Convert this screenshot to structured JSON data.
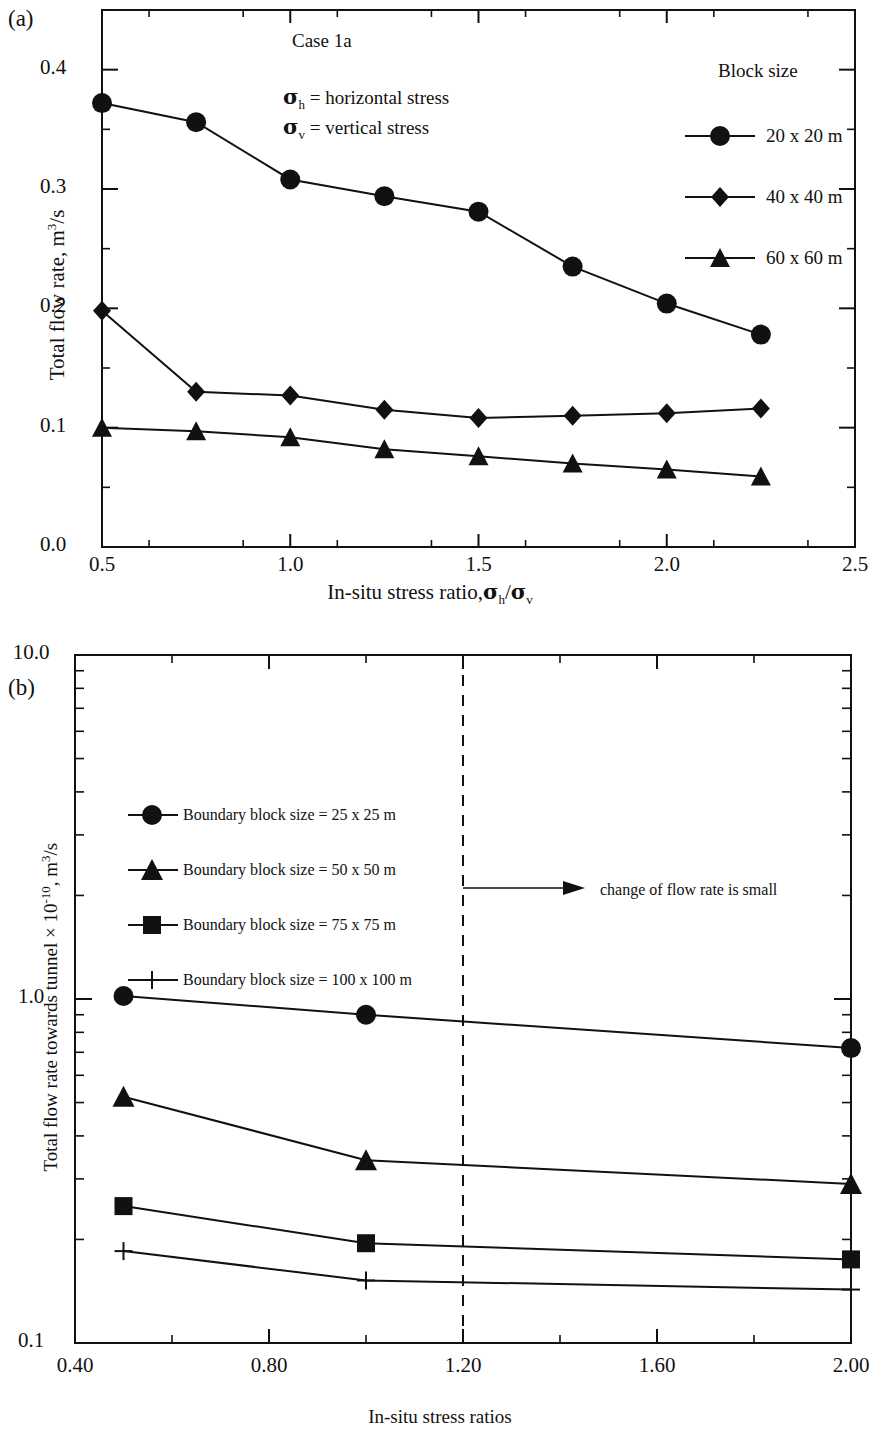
{
  "figure": {
    "panel_a_label": "(a)",
    "panel_b_label": "(b)"
  },
  "chart_data": [
    {
      "id": "panel-a",
      "type": "line",
      "title": "Case 1a",
      "xlabel": "In-situ stress ratio,σh/σv",
      "ylabel": "Total flow rate, m3/s",
      "ylabel_parts": {
        "prefix": "Total flow rate, m",
        "sup": "3",
        "suffix": "/s"
      },
      "xlabel_parts": {
        "prefix": "In-situ stress ratio,",
        "sigma1": "σ",
        "sub1": "h",
        "slash": "/",
        "sigma2": "σ",
        "sub2": "v"
      },
      "legend_title": "Block size",
      "legend_position": "top-right-inside",
      "grid": false,
      "xlim": [
        0.5,
        2.5
      ],
      "ylim": [
        0.0,
        0.45
      ],
      "xticks": [
        "0.5",
        "1.0",
        "1.5",
        "2.0",
        "2.5"
      ],
      "xtick_values": [
        0.5,
        1.0,
        1.5,
        2.0,
        2.5
      ],
      "yticks": [
        "0.0",
        "0.1",
        "0.2",
        "0.3",
        "0.4"
      ],
      "ytick_values": [
        0.0,
        0.1,
        0.2,
        0.3,
        0.4
      ],
      "x": [
        0.5,
        0.75,
        1.0,
        1.25,
        1.5,
        1.75,
        2.0,
        2.25
      ],
      "series": [
        {
          "name": "20 x 20 m",
          "marker": "circle",
          "values": [
            0.372,
            0.356,
            0.308,
            0.294,
            0.281,
            0.235,
            0.204,
            0.178
          ]
        },
        {
          "name": "40 x 40 m",
          "marker": "diamond",
          "values": [
            0.198,
            0.13,
            0.127,
            0.115,
            0.108,
            0.11,
            0.112,
            0.116
          ]
        },
        {
          "name": "60 x 60 m",
          "marker": "triangle",
          "values": [
            0.1,
            0.097,
            0.092,
            0.082,
            0.076,
            0.07,
            0.065,
            0.059
          ]
        }
      ],
      "annotations": [
        {
          "name": "sigma-h-definition",
          "sigma": "σ",
          "sub": "h",
          "text": "= horizontal stress"
        },
        {
          "name": "sigma-v-definition",
          "sigma": "σ",
          "sub": "v",
          "text": "= vertical stress"
        }
      ]
    },
    {
      "id": "panel-b",
      "type": "line",
      "xlabel": "In-situ stress ratios",
      "ylabel": "Total flow rate towards tunnel × 10-10, m3/s",
      "ylabel_parts": {
        "prefix": "Total flow rate towards tunnel × 10",
        "sup1": "-10",
        "mid": ", m",
        "sup2": "3",
        "suffix": "/s"
      },
      "yscale": "log",
      "grid": false,
      "legend_position": "upper-left-inside",
      "xlim": [
        0.4,
        2.0
      ],
      "ylim": [
        0.1,
        10.0
      ],
      "xticks": [
        "0.40",
        "0.80",
        "1.20",
        "1.60",
        "2.00"
      ],
      "xtick_values": [
        0.4,
        0.8,
        1.2,
        1.6,
        2.0
      ],
      "yticks": [
        "0.1",
        "1.0",
        "10.0"
      ],
      "ytick_values": [
        0.1,
        1.0,
        10.0
      ],
      "x": [
        0.5,
        1.0,
        2.0
      ],
      "series": [
        {
          "name": "Boundary block size = 25 x 25 m",
          "marker": "circle",
          "values": [
            1.02,
            0.9,
            0.72
          ]
        },
        {
          "name": "Boundary block size = 50 x 50 m",
          "marker": "triangle",
          "values": [
            0.52,
            0.34,
            0.29
          ]
        },
        {
          "name": "Boundary block size = 75 x 75 m",
          "marker": "square",
          "values": [
            0.25,
            0.195,
            0.175
          ]
        },
        {
          "name": "Boundary block size = 100 x 100 m",
          "marker": "plus",
          "values": [
            0.185,
            0.152,
            0.143
          ]
        }
      ],
      "reference_line": {
        "name": "threshold-line",
        "x": 1.2,
        "style": "dashed"
      },
      "annotations": [
        {
          "name": "flow-change-note",
          "text": "change of flow rate is small",
          "arrow": true,
          "from_x": 1.2
        }
      ]
    }
  ]
}
